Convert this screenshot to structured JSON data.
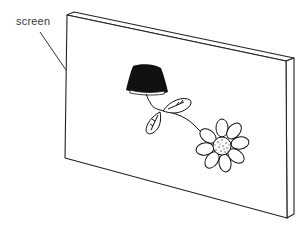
{
  "diagram": {
    "labels": {
      "screen": "screen"
    },
    "objects": [
      {
        "name": "screen-board",
        "description": "thin rectangular board viewed in perspective"
      },
      {
        "name": "bell-shaped-object",
        "description": "dark filled bell/lamp shape drawn on screen"
      },
      {
        "name": "leaves",
        "description": "two outlined leaves on a curved stem"
      },
      {
        "name": "flower",
        "description": "daisy-like flower with stippled center"
      }
    ],
    "colors": {
      "line": "#222222",
      "fill_dark": "#111111",
      "background": "#ffffff"
    }
  }
}
